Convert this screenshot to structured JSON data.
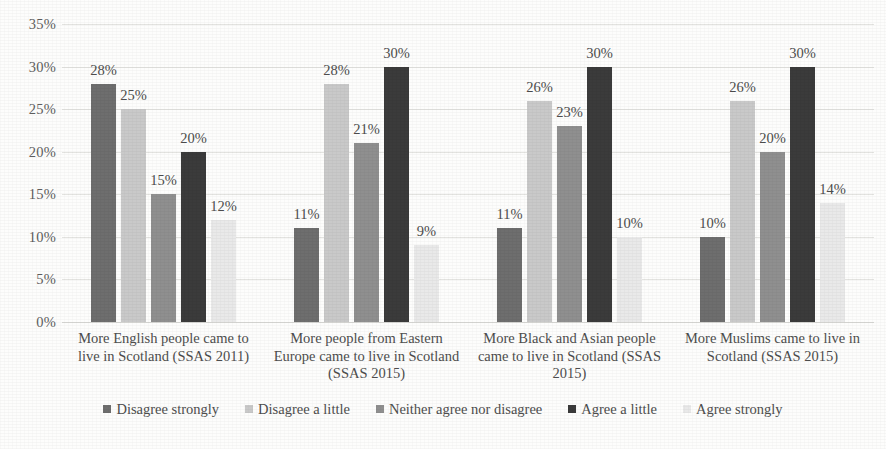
{
  "chart_data": {
    "type": "bar",
    "title": "",
    "xlabel": "",
    "ylabel": "",
    "ylim": [
      0,
      35
    ],
    "ytick_labels": [
      "35%",
      "30%",
      "25%",
      "20%",
      "15%",
      "10%",
      "5%",
      "0%"
    ],
    "ytick_values": [
      35,
      30,
      25,
      20,
      15,
      10,
      5,
      0
    ],
    "grid": true,
    "legend_position": "bottom",
    "value_label_suffix": "%",
    "categories": [
      "More English people came to live in Scotland (SSAS 2011)",
      "More people from Eastern Europe came to live in Scotland (SSAS 2015)",
      "More Black and Asian people came to live in Scotland (SSAS 2015)",
      "More Muslims came to live in Scotland (SSAS 2015)"
    ],
    "series": [
      {
        "name": "Disagree strongly",
        "color": "#6e6e6e",
        "values": [
          28,
          11,
          11,
          10
        ],
        "labels": [
          "28%",
          "11%",
          "11%",
          "10%"
        ]
      },
      {
        "name": "Disagree a little",
        "color": "#c9c9c9",
        "values": [
          25,
          28,
          26,
          26
        ],
        "labels": [
          "25%",
          "28%",
          "26%",
          "26%"
        ]
      },
      {
        "name": "Neither agree nor disagree",
        "color": "#8f8f8f",
        "values": [
          15,
          21,
          23,
          20
        ],
        "labels": [
          "15%",
          "21%",
          "23%",
          "20%"
        ]
      },
      {
        "name": "Agree a little",
        "color": "#3b3b3b",
        "values": [
          20,
          30,
          30,
          30
        ],
        "labels": [
          "20%",
          "30%",
          "30%",
          "30%"
        ]
      },
      {
        "name": "Agree strongly",
        "color": "#e9e9e9",
        "values": [
          12,
          9,
          10,
          14
        ],
        "labels": [
          "12%",
          "9%",
          "10%",
          "14%"
        ]
      }
    ]
  }
}
